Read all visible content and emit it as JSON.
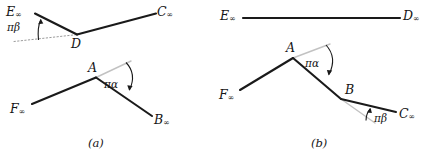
{
  "figure": {
    "title": "",
    "stroke_color": "#1a1a1a",
    "guide_color": "#b9b9b9",
    "background": "#ffffff"
  },
  "panels": [
    {
      "id": "a",
      "caption": "(a)",
      "labels": {
        "E": "E",
        "E_sub": "∞",
        "D": "D",
        "C": "C",
        "C_sub": "∞",
        "A": "A",
        "F": "F",
        "F_sub": "∞",
        "B": "B",
        "B_sub": "∞",
        "pi_beta": "πβ",
        "pi_alpha": "πα"
      }
    },
    {
      "id": "b",
      "caption": "(b)",
      "labels": {
        "E": "E",
        "E_sub": "∞",
        "D": "D",
        "D_sub": "∞",
        "A": "A",
        "B": "B",
        "C": "C",
        "C_sub": "∞",
        "F": "F",
        "F_sub": "∞",
        "pi_alpha": "πα",
        "pi_beta": "πβ"
      }
    }
  ]
}
